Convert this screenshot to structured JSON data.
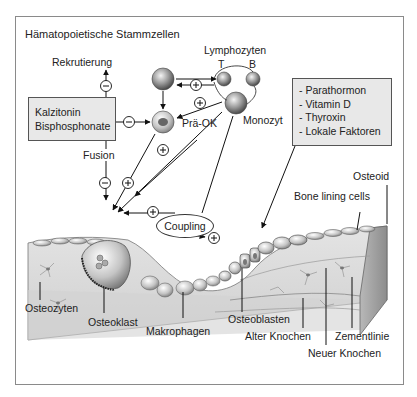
{
  "title": "Hämatopoietische Stammzellen",
  "labels": {
    "rekrutierung": "Rekrutierung",
    "lymphozyten": "Lymphozyten",
    "t": "T",
    "b": "B",
    "monozyt": "Monozyt",
    "prae_ok": "Prä-OK",
    "fusion": "Fusion",
    "coupling": "Coupling",
    "osteoid": "Osteoid",
    "bone_lining_cells": "Bone lining cells",
    "osteozyten": "Osteozyten",
    "osteoklast": "Osteoklast",
    "makrophagen": "Makrophagen",
    "osteoblasten": "Osteoblasten",
    "alter_knochen": "Alter Knochen",
    "zementlinie": "Zementlinie",
    "neuer_knochen": "Neuer Knochen"
  },
  "inhibitors_box": {
    "lines": [
      "Kalzitonin",
      "Bisphosphonate"
    ]
  },
  "factors_box": {
    "lines": [
      "- Parathormon",
      "- Vitamin D",
      "- Thyroxin",
      "- Lokale Faktoren"
    ]
  },
  "signs": {
    "minus": "−",
    "plus": "+"
  },
  "colors": {
    "box_fill": "#e8e8e8",
    "bone": "#d9d9d9",
    "line": "#222222"
  }
}
